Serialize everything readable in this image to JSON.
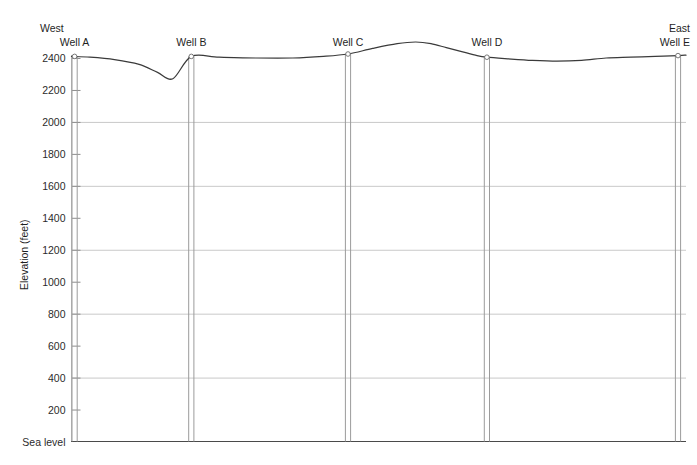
{
  "chart_data": {
    "type": "line",
    "title": "",
    "subtitle": "",
    "xlabel": "",
    "ylabel": "Elevation (feet)",
    "ylim": [
      0,
      2500
    ],
    "xlim": [
      0,
      100
    ],
    "grid": "horizontal-major-400ft",
    "legend": "none",
    "y_ticks": [
      {
        "value": 2400,
        "label": "2400",
        "major": false
      },
      {
        "value": 2200,
        "label": "2200",
        "major": false
      },
      {
        "value": 2000,
        "label": "2000",
        "major": true
      },
      {
        "value": 1800,
        "label": "1800",
        "major": false
      },
      {
        "value": 1600,
        "label": "1600",
        "major": true
      },
      {
        "value": 1400,
        "label": "1400",
        "major": false
      },
      {
        "value": 1200,
        "label": "1200",
        "major": true
      },
      {
        "value": 1000,
        "label": "1000",
        "major": false
      },
      {
        "value": 800,
        "label": "800",
        "major": true
      },
      {
        "value": 600,
        "label": "600",
        "major": false
      },
      {
        "value": 400,
        "label": "400",
        "major": true
      },
      {
        "value": 200,
        "label": "200",
        "major": false
      },
      {
        "value": 0,
        "label": "Sea level",
        "major": true
      }
    ],
    "orientation": {
      "left_label": "West",
      "right_label": "East"
    },
    "wells": [
      {
        "name": "Well A",
        "x_pct": 0.5,
        "surface_elevation": 2410,
        "bottom_elevation": 0
      },
      {
        "name": "Well B",
        "x_pct": 19.5,
        "surface_elevation": 2410,
        "bottom_elevation": 0
      },
      {
        "name": "Well C",
        "x_pct": 45.0,
        "surface_elevation": 2425,
        "bottom_elevation": 0
      },
      {
        "name": "Well D",
        "x_pct": 67.6,
        "surface_elevation": 2405,
        "bottom_elevation": 0
      },
      {
        "name": "Well E",
        "x_pct": 98.7,
        "surface_elevation": 2415,
        "bottom_elevation": 0
      }
    ],
    "series": [
      {
        "name": "Land surface",
        "x": [
          0.0,
          3.0,
          7.0,
          11.0,
          14.0,
          16.5,
          19.5,
          24.0,
          30.0,
          36.0,
          41.0,
          45.0,
          49.0,
          53.0,
          56.0,
          58.5,
          61.0,
          63.5,
          66.0,
          67.6,
          71.0,
          75.0,
          79.0,
          83.0,
          87.0,
          91.0,
          95.0,
          98.7,
          100.0
        ],
        "y": [
          2410,
          2405,
          2390,
          2360,
          2310,
          2270,
          2410,
          2405,
          2400,
          2400,
          2410,
          2425,
          2460,
          2490,
          2500,
          2490,
          2465,
          2440,
          2415,
          2405,
          2395,
          2385,
          2380,
          2385,
          2400,
          2405,
          2410,
          2415,
          2418
        ]
      }
    ]
  }
}
